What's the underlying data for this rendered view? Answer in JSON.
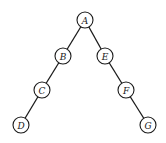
{
  "diagram": {
    "type": "binary-tree",
    "colors": {
      "stroke": "#1a1a1a",
      "node_fill": "#ffffff",
      "background": "#ffffff"
    },
    "node_radius": 8,
    "nodes": [
      {
        "id": "A",
        "label": "A",
        "x": 85,
        "y": 20
      },
      {
        "id": "B",
        "label": "B",
        "x": 63,
        "y": 56
      },
      {
        "id": "E",
        "label": "E",
        "x": 105,
        "y": 56
      },
      {
        "id": "C",
        "label": "C",
        "x": 42,
        "y": 90
      },
      {
        "id": "F",
        "label": "F",
        "x": 126,
        "y": 90
      },
      {
        "id": "D",
        "label": "D",
        "x": 21,
        "y": 125
      },
      {
        "id": "G",
        "label": "G",
        "x": 148,
        "y": 125
      }
    ],
    "edges": [
      {
        "from": "A",
        "to": "B"
      },
      {
        "from": "A",
        "to": "E"
      },
      {
        "from": "B",
        "to": "C"
      },
      {
        "from": "C",
        "to": "D"
      },
      {
        "from": "E",
        "to": "F"
      },
      {
        "from": "F",
        "to": "G"
      }
    ]
  }
}
